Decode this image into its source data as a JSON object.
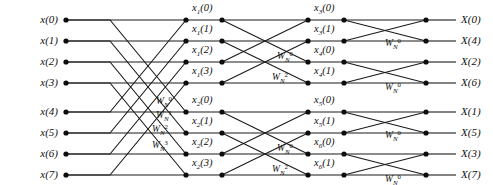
{
  "figure": {
    "background": "#ffffff",
    "line_color": "#1a1a1a",
    "node_color": "#0d0d0d",
    "text_color": "#111111"
  },
  "inputs": [
    {
      "label": "x(0)"
    },
    {
      "label": "x(1)"
    },
    {
      "label": "x(2)"
    },
    {
      "label": "x(3)"
    },
    {
      "label": "x(4)"
    },
    {
      "label": "x(5)"
    },
    {
      "label": "x(6)"
    },
    {
      "label": "x(7)"
    }
  ],
  "outputs": [
    {
      "label": "X(0)"
    },
    {
      "label": "X(4)"
    },
    {
      "label": "X(2)"
    },
    {
      "label": "X(6)"
    },
    {
      "label": "X(1)"
    },
    {
      "label": "X(5)"
    },
    {
      "label": "X(3)"
    },
    {
      "label": "X(7)"
    }
  ],
  "stage2_labels": [
    {
      "base": "x",
      "sub": "1",
      "arg": "(0)"
    },
    {
      "base": "x",
      "sub": "1",
      "arg": "(1)"
    },
    {
      "base": "x",
      "sub": "1",
      "arg": "(2)"
    },
    {
      "base": "x",
      "sub": "1",
      "arg": "(3)"
    },
    {
      "base": "x",
      "sub": "2",
      "arg": "(0)"
    },
    {
      "base": "x",
      "sub": "2",
      "arg": "(1)"
    },
    {
      "base": "x",
      "sub": "2",
      "arg": "(2)"
    },
    {
      "base": "x",
      "sub": "2",
      "arg": "(3)"
    }
  ],
  "stage3_labels": [
    {
      "base": "x",
      "sub": "3",
      "arg": "(0)"
    },
    {
      "base": "x",
      "sub": "3",
      "arg": "(1)"
    },
    {
      "base": "x",
      "sub": "4",
      "arg": "(0)"
    },
    {
      "base": "x",
      "sub": "4",
      "arg": "(1)"
    },
    {
      "base": "x",
      "sub": "5",
      "arg": "(0)"
    },
    {
      "base": "x",
      "sub": "5",
      "arg": "(1)"
    },
    {
      "base": "x",
      "sub": "6",
      "arg": "(0)"
    },
    {
      "base": "x",
      "sub": "6",
      "arg": "(1)"
    }
  ],
  "twiddles_stage1": [
    {
      "base": "W",
      "sub": "N",
      "sup": "0"
    },
    {
      "base": "W",
      "sub": "N",
      "sup": "1"
    },
    {
      "base": "W",
      "sub": "N",
      "sup": "2"
    },
    {
      "base": "W",
      "sub": "N",
      "sup": "3"
    }
  ],
  "twiddles_stage2": [
    {
      "base": "W",
      "sub": "N",
      "sup": "0"
    },
    {
      "base": "W",
      "sub": "N",
      "sup": "2"
    },
    {
      "base": "W",
      "sub": "N",
      "sup": "0"
    },
    {
      "base": "W",
      "sub": "N",
      "sup": "2"
    }
  ],
  "twiddles_stage3": [
    {
      "base": "W",
      "sub": "N",
      "sup": "0"
    },
    {
      "base": "W",
      "sub": "N",
      "sup": "0"
    },
    {
      "base": "W",
      "sub": "N",
      "sup": "0"
    },
    {
      "base": "W",
      "sub": "N",
      "sup": "0"
    }
  ],
  "geometry": {
    "rows_y": [
      20,
      41,
      62,
      83,
      112,
      133,
      154,
      175
    ],
    "col_x": [
      66,
      186,
      222,
      308,
      344,
      426
    ],
    "node_radius": 2.6
  }
}
